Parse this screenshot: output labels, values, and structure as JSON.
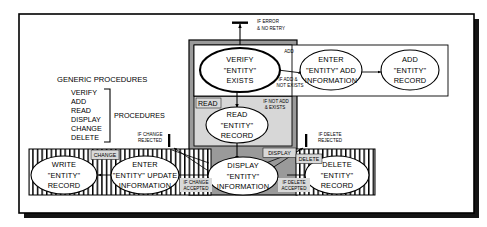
{
  "diagram": {
    "title_legend": "GENERIC PROCEDURES",
    "procedures_bracket_label": "PROCEDURES",
    "generic_procedures": [
      "VERIFY",
      "ADD",
      "READ",
      "DISPLAY",
      "CHANGE",
      "DELETE"
    ],
    "colors": {
      "frame_border": "#000000",
      "shadow": "#111111",
      "read_region_fill": "#d7d7d7",
      "display_region_fill": "#9a9a9a",
      "verify_region_fill": "#ffffff",
      "tag_fill": "#d9d9d9",
      "node_fill": "#ffffff",
      "stripe_stroke": "#000000",
      "page_background": "#ffffff"
    },
    "regions": [
      {
        "name": "verify-region",
        "label": ""
      },
      {
        "name": "add-region",
        "label": ""
      },
      {
        "name": "read-region",
        "label": "READ"
      },
      {
        "name": "display-region",
        "label": "DISPLAY"
      },
      {
        "name": "change-region",
        "label": "CHANGE"
      },
      {
        "name": "delete-region",
        "label": "DELETE"
      }
    ],
    "nodes": [
      {
        "id": "verify",
        "lines": [
          "VERIFY",
          "\"ENTITY\"",
          "EXISTS"
        ]
      },
      {
        "id": "enter-add",
        "lines": [
          "ENTER",
          "\"ENTITY\" ADD",
          "INFORMATION"
        ]
      },
      {
        "id": "add-record",
        "lines": [
          "ADD",
          "\"ENTITY\"",
          "RECORD"
        ]
      },
      {
        "id": "read-record",
        "lines": [
          "READ",
          "\"ENTITY\"",
          "RECORD"
        ]
      },
      {
        "id": "display-info",
        "lines": [
          "DISPLAY",
          "\"ENTITY\"",
          "INFORMATION"
        ]
      },
      {
        "id": "write-record",
        "lines": [
          "WRITE",
          "\"ENTITY\"",
          "RECORD"
        ]
      },
      {
        "id": "enter-update",
        "lines": [
          "ENTER",
          "\"ENTITY\" UPDATE",
          "INFORMATION"
        ]
      },
      {
        "id": "delete-record",
        "lines": [
          "DELETE",
          "\"ENTITY\"",
          "RECORD"
        ]
      }
    ],
    "edge_labels": {
      "error_no_retry": [
        "IF ERROR",
        "& NO RETRY"
      ],
      "add": "ADD",
      "if_add_not_exists": [
        "IF ADD &",
        "NOT EXISTS"
      ],
      "if_not_add_exists": [
        "IF NOT ADD",
        "& EXISTS"
      ],
      "read_tag": "READ",
      "display_tag": "DISPLAY",
      "change_tag": "CHANGE",
      "delete_tag": "DELETE",
      "if_change_rejected": [
        "IF CHANGE",
        "REJECTED"
      ],
      "if_change_accepted": [
        "IF CHANGE",
        "ACCEPTED"
      ],
      "if_delete_rejected": [
        "IF DELETE",
        "REJECTED"
      ],
      "if_delete_accepted": [
        "IF DELETE",
        "ACCEPTED"
      ]
    }
  }
}
